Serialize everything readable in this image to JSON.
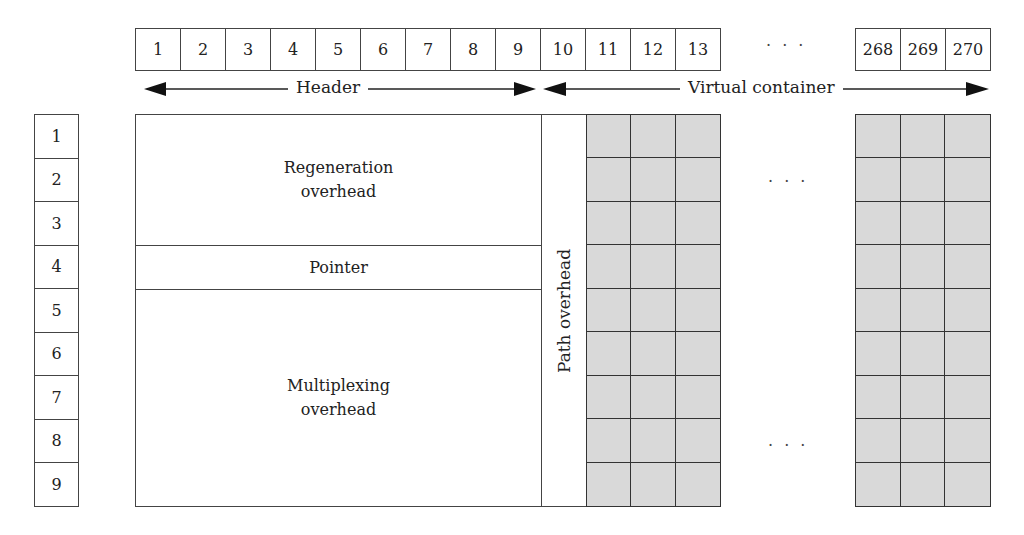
{
  "diagram": {
    "columns": {
      "header_columns": [
        "1",
        "2",
        "3",
        "4",
        "5",
        "6",
        "7",
        "8",
        "9"
      ],
      "vc_columns_start": [
        "10",
        "11",
        "12",
        "13"
      ],
      "ellipsis": "· · ·",
      "vc_columns_end": [
        "268",
        "269",
        "270"
      ]
    },
    "arrows": {
      "header_label": "Header",
      "virtual_container_label": "Virtual container"
    },
    "rows": [
      "1",
      "2",
      "3",
      "4",
      "5",
      "6",
      "7",
      "8",
      "9"
    ],
    "sections": {
      "regeneration": "Regeneration overhead",
      "pointer": "Pointer",
      "multiplexing": "Multiplexing overhead",
      "path": "Path overhead"
    },
    "grid_ellipsis_top": "· · ·",
    "grid_ellipsis_bottom": "· · ·",
    "colors": {
      "payload_fill": "#d9d9d9",
      "line": "#333333"
    }
  }
}
